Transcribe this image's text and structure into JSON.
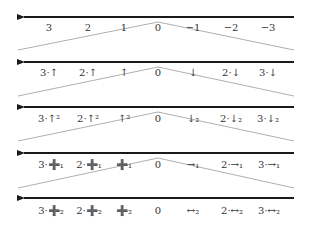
{
  "diagram": {
    "colors": {
      "axis": "#1a1a1a",
      "connector": "#9a9a9a",
      "text": "#333333"
    },
    "rows": [
      {
        "y": 17,
        "labels": [
          "3",
          "2",
          "1",
          "0",
          "−1",
          "−2",
          "−3"
        ]
      },
      {
        "y": 62,
        "labels": [
          "3·↑",
          "2·↑",
          "↑",
          "0",
          "↓",
          "2·↓",
          "3·↓"
        ]
      },
      {
        "y": 107,
        "labels": [
          "3·↑²",
          "2·↑²",
          "↑²",
          "0",
          "↓₂",
          "2·↓₂",
          "3·↓₂"
        ]
      },
      {
        "y": 153,
        "labels": [
          "3·➕₁",
          "2·➕₁",
          "➕₁",
          "0",
          "→₁",
          "2·→₁",
          "3·→₁"
        ]
      },
      {
        "y": 198,
        "labels": [
          "3·➕₂",
          "2·➕₂",
          "➕₂",
          "0",
          "↔₂",
          "2·↔₂",
          "3·↔₂"
        ]
      }
    ],
    "label_x": [
      49,
      88,
      124,
      158,
      193,
      231,
      266
    ]
  }
}
